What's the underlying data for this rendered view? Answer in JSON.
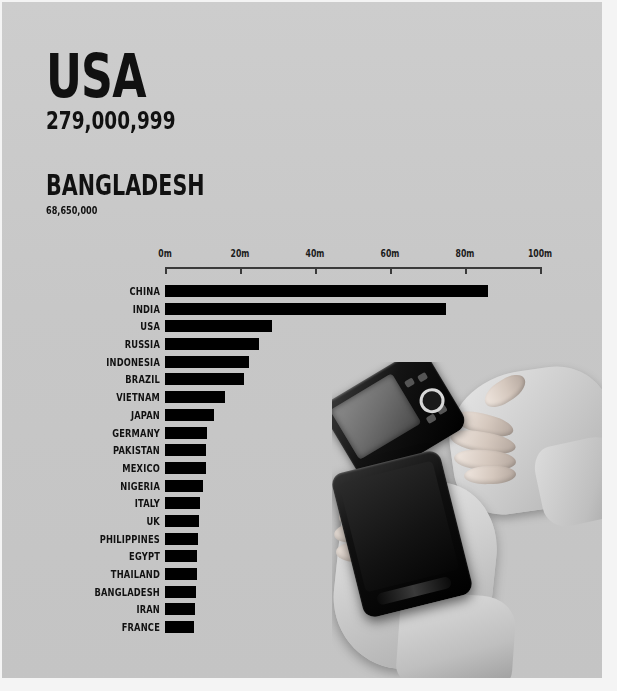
{
  "headline": {
    "country": "USA",
    "value": "279,000,999"
  },
  "subheadline": {
    "country": "BANGLADESH",
    "value": "68,650,000"
  },
  "photo": {
    "description": "two-hands-holding-smartphones",
    "items": [
      "phone-top",
      "phone-bottom",
      "hand-upper",
      "hand-lower"
    ]
  },
  "chart_data": {
    "type": "bar",
    "orientation": "horizontal",
    "title": "",
    "xlabel": "",
    "ylabel": "",
    "xlim": [
      0,
      100
    ],
    "grid": false,
    "legend": null,
    "unit": "millions",
    "tick_labels": [
      "0m",
      "20m",
      "40m",
      "60m",
      "80m",
      "100m"
    ],
    "tick_values": [
      0,
      20,
      40,
      60,
      80,
      100
    ],
    "categories": [
      "CHINA",
      "INDIA",
      "USA",
      "RUSSIA",
      "INDONESIA",
      "BRAZIL",
      "VIETNAM",
      "JAPAN",
      "GERMANY",
      "PAKISTAN",
      "MEXICO",
      "NIGERIA",
      "ITALY",
      "UK",
      "PHILIPPINES",
      "EGYPT",
      "THAILAND",
      "BANGLADESH",
      "IRAN",
      "FRANCE"
    ],
    "values": [
      86,
      75,
      28.5,
      25,
      22.5,
      21,
      16,
      13,
      11.2,
      11,
      10.8,
      10,
      9.4,
      9,
      8.8,
      8.6,
      8.4,
      8.2,
      8,
      7.8
    ]
  },
  "colors": {
    "background": "#c9c9c9",
    "bar": "#000000",
    "text": "#111111",
    "axis": "#3a3a3a"
  }
}
